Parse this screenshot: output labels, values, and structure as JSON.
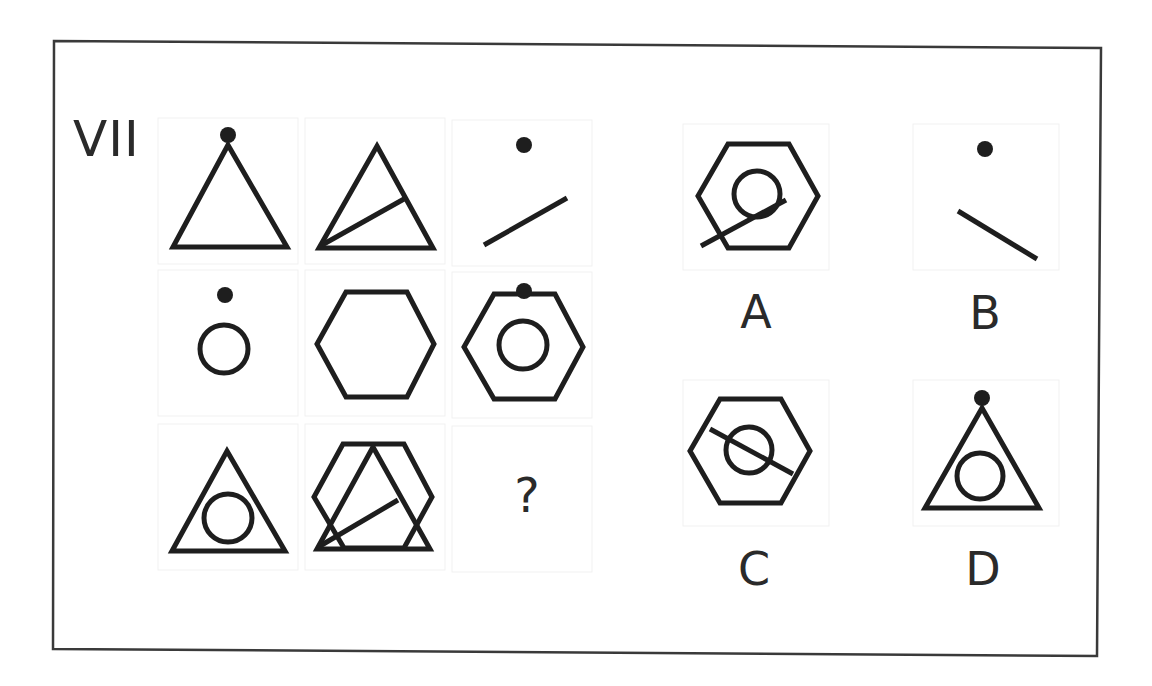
{
  "puzzle": {
    "number_label": "VII",
    "question_mark": "?",
    "grid": {
      "rows": 3,
      "cols": 3,
      "cells": [
        {
          "row": 1,
          "col": 1,
          "content": [
            "dot",
            "triangle"
          ]
        },
        {
          "row": 1,
          "col": 2,
          "content": [
            "triangle",
            "line"
          ]
        },
        {
          "row": 1,
          "col": 3,
          "content": [
            "dot",
            "line"
          ]
        },
        {
          "row": 2,
          "col": 1,
          "content": [
            "dot",
            "circle"
          ]
        },
        {
          "row": 2,
          "col": 2,
          "content": [
            "hexagon"
          ]
        },
        {
          "row": 2,
          "col": 3,
          "content": [
            "dot",
            "hexagon",
            "circle"
          ]
        },
        {
          "row": 3,
          "col": 1,
          "content": [
            "triangle",
            "circle"
          ]
        },
        {
          "row": 3,
          "col": 2,
          "content": [
            "hexagon",
            "triangle",
            "line"
          ]
        },
        {
          "row": 3,
          "col": 3,
          "content": [
            "missing"
          ]
        }
      ]
    },
    "options": [
      {
        "label": "A",
        "content": [
          "hexagon",
          "circle",
          "line"
        ]
      },
      {
        "label": "B",
        "content": [
          "dot",
          "line"
        ]
      },
      {
        "label": "C",
        "content": [
          "hexagon",
          "circle",
          "line"
        ]
      },
      {
        "label": "D",
        "content": [
          "dot",
          "triangle",
          "circle"
        ]
      }
    ]
  },
  "colors": {
    "ink": "#1e1e1e",
    "frame": "#3a3a3a",
    "background": "#ffffff"
  }
}
